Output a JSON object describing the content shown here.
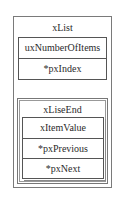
{
  "diagram": {
    "list": {
      "title": "xList",
      "fields": [
        "uxNumberOfItems",
        "*pxIndex"
      ]
    },
    "list_end": {
      "title": "xLiseEnd",
      "fields": [
        "xItemValue",
        "*pxPrevious",
        "*pxNext"
      ]
    }
  }
}
